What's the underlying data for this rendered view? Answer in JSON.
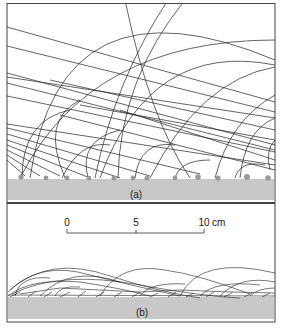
{
  "figure": {
    "panel_a": {
      "label": "(a)"
    },
    "panel_b": {
      "label": "(b)"
    },
    "scale_bar": {
      "ticks": [
        "0",
        "5",
        "10"
      ],
      "unit": "cm"
    }
  },
  "colors": {
    "ground": "#c8c8c8",
    "particle": "#9a9a9a",
    "line": "#222222",
    "frame": "#444444"
  }
}
